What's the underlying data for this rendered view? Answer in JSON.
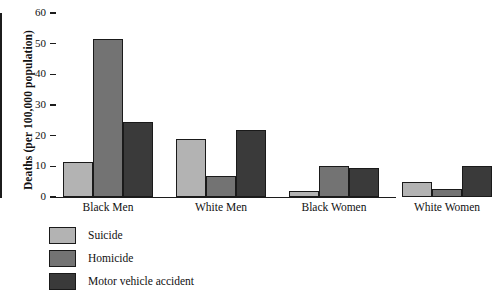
{
  "chart_data": {
    "type": "bar",
    "title": "",
    "xlabel": "",
    "ylabel": "Deaths (per 100,000 population)",
    "categories": [
      "Black Men",
      "White Men",
      "Black Women",
      "White Women"
    ],
    "series": [
      {
        "name": "Suicide",
        "color": "#b3b3b3",
        "values": [
          11.5,
          19.0,
          2.0,
          5.0
        ]
      },
      {
        "name": "Homicide",
        "color": "#737373",
        "values": [
          51.5,
          7.0,
          10.0,
          2.5
        ]
      },
      {
        "name": "Motor vehicle accident",
        "color": "#3a3a3a",
        "values": [
          24.5,
          22.0,
          9.5,
          10.0
        ]
      }
    ],
    "ylim": [
      0,
      60
    ],
    "yticks": [
      0,
      10,
      20,
      30,
      40,
      50,
      60
    ],
    "ytick_labels": [
      "0",
      "10",
      "20",
      "30",
      "40",
      "50",
      "60"
    ],
    "grid": false,
    "legend_position": "below-left"
  },
  "legend": {
    "items": [
      {
        "label": "Suicide"
      },
      {
        "label": "Homicide"
      },
      {
        "label": "Motor vehicle accident"
      }
    ]
  }
}
